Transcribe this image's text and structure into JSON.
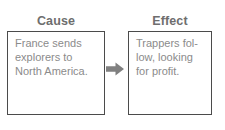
{
  "diagram": {
    "type": "cause-and-effect",
    "colors": {
      "background": "#ffffff",
      "box_border": "#4b4b4b",
      "heading_text": "#6e6e6e",
      "body_text": "#8b8b8b",
      "arrow": "#808080"
    },
    "nodes": [
      {
        "id": "cause",
        "heading": "Cause",
        "text": "France sends\nexplorers to\nNorth America.",
        "lines": [
          "France sends",
          "explorers to",
          "North America."
        ]
      },
      {
        "id": "effect",
        "heading": "Effect",
        "text": "Trappers fol-\nlow, looking\nfor profit.",
        "lines": [
          "Trappers fol-",
          "low, looking",
          "for profit."
        ]
      }
    ],
    "connector": {
      "icon": "arrow-right-icon",
      "from": "cause",
      "to": "effect",
      "direction": "right"
    }
  }
}
